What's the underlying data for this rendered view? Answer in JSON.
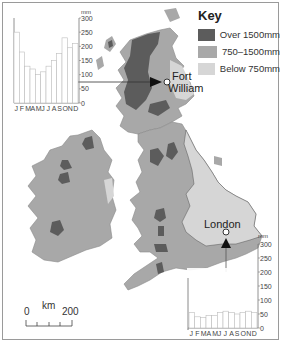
{
  "key": {
    "title": "Key",
    "items": [
      {
        "label": "Over 1500mm",
        "color": "#5c5c5c"
      },
      {
        "label": "750–1500mm",
        "color": "#a8a8a8"
      },
      {
        "label": "Below 750mm",
        "color": "#d6d6d6"
      }
    ]
  },
  "cities": {
    "fort_william": {
      "line1": "Fort",
      "line2": "William"
    },
    "london": {
      "label": "London"
    }
  },
  "scale": {
    "start": "0",
    "unit": "km",
    "end": "200"
  },
  "chart_data": [
    {
      "type": "bar",
      "title": "Fort William monthly rainfall",
      "categories": [
        "J",
        "F",
        "M",
        "A",
        "M",
        "J",
        "J",
        "A",
        "S",
        "O",
        "N",
        "D"
      ],
      "values": [
        250,
        180,
        130,
        120,
        100,
        110,
        130,
        150,
        175,
        230,
        195,
        210
      ],
      "ylabel": "mm",
      "yticks": [
        "0",
        "50",
        "100",
        "150",
        "200",
        "250",
        "300"
      ],
      "ylim": [
        0,
        300
      ]
    },
    {
      "type": "bar",
      "title": "London monthly rainfall",
      "categories": [
        "J",
        "F",
        "M",
        "A",
        "M",
        "J",
        "J",
        "A",
        "S",
        "O",
        "N",
        "D"
      ],
      "values": [
        55,
        40,
        37,
        45,
        45,
        55,
        60,
        55,
        50,
        55,
        60,
        55
      ],
      "ylabel": "mm",
      "yticks": [
        "0",
        "50",
        "100",
        "150",
        "200",
        "250",
        "300"
      ],
      "ylim": [
        0,
        300
      ]
    }
  ]
}
